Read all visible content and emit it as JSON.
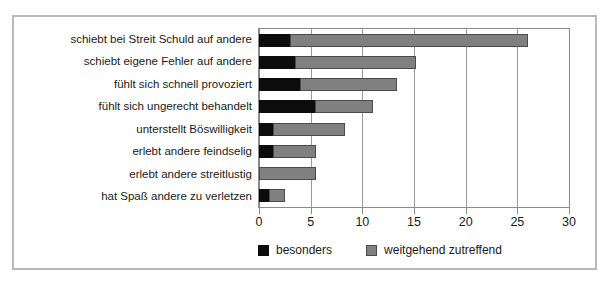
{
  "chart_data": {
    "type": "bar",
    "orientation": "horizontal",
    "stacked": true,
    "title": "",
    "xlabel": "",
    "ylabel": "",
    "xlim": [
      0,
      30
    ],
    "xticks": [
      0,
      5,
      10,
      15,
      20,
      25,
      30
    ],
    "xtick_labels": [
      "0",
      "5",
      "10",
      "15",
      "20",
      "25",
      "30"
    ],
    "grid": true,
    "grid_axis": "x",
    "legend_position": "bottom",
    "categories": [
      "schiebt bei Streit Schuld auf andere",
      "schiebt eigene Fehler auf andere",
      "fühlt sich schnell provoziert",
      "fühlt sich ungerecht behandelt",
      "unterstellt Böswilligkeit",
      "erlebt andere feindselig",
      "erlebt andere streitlustig",
      "hat Spaß andere zu verletzen"
    ],
    "series": [
      {
        "name": "besonders",
        "color": "#0c0c0c",
        "values": [
          3,
          3.5,
          4,
          5.4,
          1.4,
          1.4,
          0,
          1
        ]
      },
      {
        "name": "weitgehend zutreffend",
        "color": "#808080",
        "values": [
          23,
          11.7,
          9.4,
          5.6,
          6.9,
          4.1,
          5.5,
          1.5
        ]
      }
    ],
    "totals": [
      26,
      15.2,
      13.4,
      11,
      8.3,
      5.5,
      5.5,
      2.5
    ]
  },
  "legend": {
    "entries": [
      {
        "label": "besonders",
        "swatch": "black-swatch"
      },
      {
        "label": "weitgehend zutreffend",
        "swatch": "gray-swatch"
      }
    ]
  }
}
